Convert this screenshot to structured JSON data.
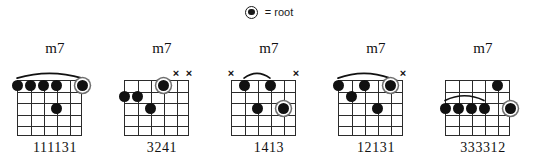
{
  "legend": {
    "symbol_name": "root-dot-symbol",
    "text": "= root"
  },
  "geometry": {
    "string_count": 6,
    "fret_count": 5,
    "grid_width": 65,
    "grid_height": 56,
    "string_spacing": 13,
    "fret_spacing": 11.2
  },
  "chords": [
    {
      "id": "chord-1",
      "name": "m7",
      "fingering": "111131",
      "barre": {
        "present": true,
        "from_string": 1,
        "to_string": 6,
        "fret": 1
      },
      "mutes": [],
      "dots": [
        {
          "string": 1,
          "fret": 1,
          "root": false
        },
        {
          "string": 2,
          "fret": 1,
          "root": false
        },
        {
          "string": 3,
          "fret": 1,
          "root": false
        },
        {
          "string": 4,
          "fret": 1,
          "root": false
        },
        {
          "string": 4,
          "fret": 3,
          "root": false
        },
        {
          "string": 6,
          "fret": 1,
          "root": true
        }
      ]
    },
    {
      "id": "chord-2",
      "name": "m7",
      "fingering": "3241",
      "barre": {
        "present": false
      },
      "mutes": [
        5,
        6
      ],
      "dots": [
        {
          "string": 1,
          "fret": 2,
          "root": false
        },
        {
          "string": 2,
          "fret": 2,
          "root": false
        },
        {
          "string": 3,
          "fret": 3,
          "root": false
        },
        {
          "string": 4,
          "fret": 1,
          "root": true
        }
      ]
    },
    {
      "id": "chord-3",
      "name": "m7",
      "fingering": "1413",
      "barre": {
        "present": true,
        "from_string": 2,
        "to_string": 4,
        "fret": 1
      },
      "mutes": [
        1,
        6
      ],
      "dots": [
        {
          "string": 2,
          "fret": 1,
          "root": false
        },
        {
          "string": 3,
          "fret": 3,
          "root": false
        },
        {
          "string": 4,
          "fret": 1,
          "root": false
        },
        {
          "string": 5,
          "fret": 3,
          "root": true
        }
      ]
    },
    {
      "id": "chord-4",
      "name": "m7",
      "fingering": "12131",
      "barre": {
        "present": true,
        "from_string": 1,
        "to_string": 5,
        "fret": 1
      },
      "mutes": [
        6
      ],
      "dots": [
        {
          "string": 1,
          "fret": 1,
          "root": false
        },
        {
          "string": 2,
          "fret": 2,
          "root": false
        },
        {
          "string": 3,
          "fret": 1,
          "root": false
        },
        {
          "string": 4,
          "fret": 3,
          "root": false
        },
        {
          "string": 5,
          "fret": 1,
          "root": true
        }
      ]
    },
    {
      "id": "chord-5",
      "name": "m7",
      "fingering": "333312",
      "barre": {
        "present": true,
        "from_string": 1,
        "to_string": 4,
        "fret": 3
      },
      "mutes": [],
      "dots": [
        {
          "string": 1,
          "fret": 3,
          "root": false
        },
        {
          "string": 2,
          "fret": 3,
          "root": false
        },
        {
          "string": 3,
          "fret": 3,
          "root": false
        },
        {
          "string": 4,
          "fret": 3,
          "root": false
        },
        {
          "string": 5,
          "fret": 1,
          "root": false
        },
        {
          "string": 6,
          "fret": 3,
          "root": true
        }
      ]
    }
  ]
}
